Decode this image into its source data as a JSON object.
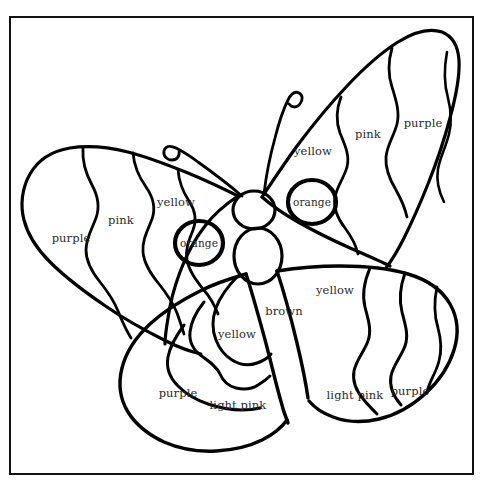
{
  "page": {
    "background_color": "#ffffff",
    "frame_color": "#121212",
    "ink_color": "#000000",
    "label_color": "#2b2b2b",
    "top_ghost_text": ""
  },
  "artwork": {
    "subject": "butterfly",
    "style": "line-art coloring page",
    "parts": [
      "left-upper-wing",
      "right-upper-wing",
      "left-lower-wing",
      "right-lower-wing",
      "head",
      "abdomen",
      "left-antenna",
      "right-antenna",
      "left-eyespot",
      "right-eyespot"
    ]
  },
  "labels": [
    {
      "id": "left-upper-purple",
      "text": "purple",
      "x": 71,
      "y": 239
    },
    {
      "id": "left-upper-pink",
      "text": "pink",
      "x": 121,
      "y": 221
    },
    {
      "id": "left-upper-yellow",
      "text": "yellow",
      "x": 176,
      "y": 203
    },
    {
      "id": "left-eyespot",
      "text": "orange",
      "x": 199,
      "y": 243
    },
    {
      "id": "right-upper-yellow",
      "text": "yellow",
      "x": 313,
      "y": 152
    },
    {
      "id": "right-upper-pink",
      "text": "pink",
      "x": 368,
      "y": 135
    },
    {
      "id": "right-upper-purple",
      "text": "purple",
      "x": 423,
      "y": 124
    },
    {
      "id": "right-eyespot",
      "text": "orange",
      "x": 312,
      "y": 202
    },
    {
      "id": "right-lower-yellow",
      "text": "yellow",
      "x": 335,
      "y": 291
    },
    {
      "id": "body-brown",
      "text": "brown",
      "x": 284,
      "y": 312
    },
    {
      "id": "left-lower-yellow",
      "text": "yellow",
      "x": 237,
      "y": 335
    },
    {
      "id": "left-lower-purple",
      "text": "purple",
      "x": 178,
      "y": 394
    },
    {
      "id": "left-lower-lightpink",
      "text": "light pink",
      "x": 238,
      "y": 406
    },
    {
      "id": "right-lower-lightpink",
      "text": "light pink",
      "x": 355,
      "y": 396
    },
    {
      "id": "right-lower-purple",
      "text": "purple",
      "x": 410,
      "y": 392
    }
  ],
  "palette": {
    "colors": [
      "purple",
      "pink",
      "yellow",
      "orange",
      "brown",
      "light pink"
    ]
  }
}
